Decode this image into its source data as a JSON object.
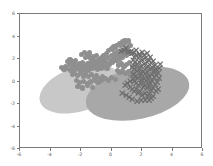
{
  "chart_data": {
    "type": "scatter",
    "title": "",
    "xlabel": "",
    "ylabel": "",
    "xlim": [
      -6,
      6
    ],
    "ylim": [
      -6,
      6
    ],
    "grid": false,
    "legend": null,
    "xticks": [
      "-6",
      "-4",
      "-2",
      "0",
      "2",
      "4",
      "6"
    ],
    "yticks": [
      "-6",
      "-4",
      "-2",
      "0",
      "2",
      "4",
      "6"
    ],
    "xtick_values": [
      -6,
      -4,
      -2,
      0,
      2,
      4,
      6
    ],
    "ytick_values": [
      -6,
      -4,
      -2,
      0,
      2,
      4,
      6
    ],
    "background_color": "#ffffff",
    "axis_color": "#7a7a7a",
    "tick_label_color": "#5b5b5b",
    "ellipses": [
      {
        "name": "cluster-ellipse-left",
        "center": [
          -2.05,
          -0.62
        ],
        "width": 2.75,
        "height": 1.95,
        "angle": -18,
        "color": "#c8c8c8",
        "opacity": 1
      },
      {
        "name": "cluster-ellipse-right",
        "center": [
          1.72,
          -1.02
        ],
        "width": 3.45,
        "height": 2.25,
        "angle": -12,
        "color": "#a8a8a8",
        "opacity": 1
      }
    ],
    "series": [
      {
        "name": "cluster-a",
        "marker": "circle",
        "color": "#8f8f8f",
        "size": 2.6,
        "points": [
          [
            -3.3,
            1.22
          ],
          [
            -3.12,
            1.05
          ],
          [
            -3.02,
            1.34
          ],
          [
            -2.86,
            1.12
          ],
          [
            -2.74,
            1.48
          ],
          [
            -2.66,
            0.95
          ],
          [
            -2.52,
            1.26
          ],
          [
            -2.44,
            1.62
          ],
          [
            -2.36,
            1.04
          ],
          [
            -2.28,
            1.4
          ],
          [
            -2.18,
            1.18
          ],
          [
            -2.1,
            1.55
          ],
          [
            -2.02,
            0.88
          ],
          [
            -1.95,
            1.3
          ],
          [
            -1.88,
            1.68
          ],
          [
            -1.8,
            1.06
          ],
          [
            -1.72,
            1.44
          ],
          [
            -1.64,
            1.22
          ],
          [
            -1.58,
            1.6
          ],
          [
            -1.5,
            0.95
          ],
          [
            -1.44,
            1.35
          ],
          [
            -1.36,
            1.72
          ],
          [
            -1.28,
            1.14
          ],
          [
            -1.2,
            1.52
          ],
          [
            -1.14,
            1.88
          ],
          [
            -1.06,
            1.28
          ],
          [
            -0.98,
            1.66
          ],
          [
            -0.9,
            1.04
          ],
          [
            -0.84,
            1.42
          ],
          [
            -0.76,
            1.8
          ],
          [
            -0.68,
            1.2
          ],
          [
            -0.6,
            1.58
          ],
          [
            -0.54,
            1.96
          ],
          [
            -0.46,
            1.36
          ],
          [
            -0.38,
            1.74
          ],
          [
            -0.3,
            1.12
          ],
          [
            -0.24,
            2.12
          ],
          [
            -0.16,
            1.52
          ],
          [
            -0.08,
            1.9
          ],
          [
            0.0,
            2.28
          ],
          [
            0.06,
            1.68
          ],
          [
            0.14,
            2.06
          ],
          [
            0.22,
            2.44
          ],
          [
            0.3,
            1.84
          ],
          [
            0.36,
            2.22
          ],
          [
            0.44,
            2.6
          ],
          [
            0.52,
            2.0
          ],
          [
            0.6,
            2.38
          ],
          [
            0.66,
            2.76
          ],
          [
            0.74,
            2.16
          ],
          [
            0.82,
            2.54
          ],
          [
            0.9,
            2.92
          ],
          [
            0.96,
            2.32
          ],
          [
            1.04,
            2.7
          ],
          [
            1.12,
            3.08
          ],
          [
            1.2,
            2.48
          ],
          [
            -2.58,
            0.62
          ],
          [
            -2.4,
            0.74
          ],
          [
            -2.22,
            0.55
          ],
          [
            -2.04,
            0.7
          ],
          [
            -1.86,
            0.48
          ],
          [
            -1.68,
            0.66
          ],
          [
            -1.5,
            0.42
          ],
          [
            -1.32,
            0.6
          ],
          [
            -1.14,
            0.36
          ],
          [
            -0.96,
            0.54
          ],
          [
            -0.78,
            0.3
          ],
          [
            -0.6,
            0.48
          ],
          [
            -2.3,
            0.08
          ],
          [
            -2.08,
            -0.12
          ],
          [
            -1.84,
            0.02
          ],
          [
            -1.6,
            -0.18
          ],
          [
            -1.38,
            -0.04
          ],
          [
            -1.12,
            0.14
          ],
          [
            -0.88,
            -0.1
          ],
          [
            -0.64,
            0.06
          ],
          [
            -0.42,
            0.26
          ],
          [
            -0.2,
            0.1
          ],
          [
            0.02,
            0.32
          ],
          [
            0.24,
            0.16
          ],
          [
            -0.34,
            2.52
          ],
          [
            -0.18,
            2.72
          ],
          [
            -0.02,
            2.9
          ],
          [
            0.16,
            3.06
          ],
          [
            0.34,
            3.22
          ],
          [
            0.52,
            3.38
          ],
          [
            0.7,
            3.52
          ],
          [
            0.88,
            3.66
          ],
          [
            -0.5,
            2.34
          ],
          [
            -0.66,
            2.16
          ],
          [
            -0.82,
            1.98
          ],
          [
            -0.98,
            2.3
          ],
          [
            0.08,
            2.86
          ],
          [
            0.26,
            3.02
          ],
          [
            0.42,
            2.66
          ],
          [
            0.58,
            3.18
          ],
          [
            -1.7,
            2.1
          ],
          [
            -1.52,
            2.26
          ],
          [
            -1.34,
            2.02
          ],
          [
            -1.16,
            2.2
          ],
          [
            -2.9,
            1.78
          ],
          [
            -2.72,
            1.92
          ],
          [
            -2.54,
            1.74
          ],
          [
            -2.36,
            1.9
          ],
          [
            0.76,
            3.3
          ],
          [
            0.94,
            3.44
          ],
          [
            1.1,
            3.6
          ],
          [
            1.26,
            3.18
          ],
          [
            -1.96,
            2.4
          ],
          [
            -1.78,
            2.56
          ],
          [
            -1.6,
            2.38
          ],
          [
            -1.42,
            2.54
          ],
          [
            0.46,
            1.46
          ],
          [
            0.64,
            1.62
          ],
          [
            0.82,
            1.3
          ],
          [
            1.0,
            1.48
          ],
          [
            1.18,
            1.66
          ],
          [
            1.36,
            1.34
          ],
          [
            1.54,
            1.52
          ],
          [
            1.72,
            1.2
          ],
          [
            0.38,
            0.98
          ],
          [
            0.56,
            0.82
          ],
          [
            0.74,
            1.0
          ],
          [
            0.92,
            0.68
          ],
          [
            1.1,
            0.86
          ],
          [
            1.28,
            0.54
          ],
          [
            1.46,
            0.72
          ],
          [
            1.64,
            0.4
          ],
          [
            -2.2,
            -0.44
          ],
          [
            -1.88,
            -0.58
          ],
          [
            -1.56,
            -0.34
          ],
          [
            -1.24,
            -0.5
          ]
        ]
      },
      {
        "name": "cluster-b",
        "marker": "x",
        "color": "#6e6e6e",
        "size": 3.2,
        "points": [
          [
            1.34,
            3.26
          ],
          [
            1.48,
            2.94
          ],
          [
            1.62,
            3.12
          ],
          [
            1.76,
            2.8
          ],
          [
            1.9,
            2.98
          ],
          [
            2.04,
            2.66
          ],
          [
            2.18,
            2.84
          ],
          [
            2.32,
            2.52
          ],
          [
            2.46,
            2.7
          ],
          [
            2.6,
            2.38
          ],
          [
            2.74,
            2.56
          ],
          [
            2.88,
            2.24
          ],
          [
            1.42,
            2.62
          ],
          [
            1.56,
            2.44
          ],
          [
            1.7,
            2.26
          ],
          [
            1.84,
            2.44
          ],
          [
            1.98,
            2.12
          ],
          [
            2.12,
            2.3
          ],
          [
            2.26,
            1.98
          ],
          [
            2.4,
            2.16
          ],
          [
            2.54,
            1.84
          ],
          [
            2.68,
            2.02
          ],
          [
            2.82,
            1.7
          ],
          [
            2.96,
            1.88
          ],
          [
            1.38,
            2.04
          ],
          [
            1.52,
            1.86
          ],
          [
            1.66,
            1.68
          ],
          [
            1.8,
            1.86
          ],
          [
            1.94,
            1.54
          ],
          [
            2.08,
            1.72
          ],
          [
            2.22,
            1.4
          ],
          [
            2.36,
            1.58
          ],
          [
            2.5,
            1.26
          ],
          [
            2.64,
            1.44
          ],
          [
            2.78,
            1.12
          ],
          [
            2.92,
            1.3
          ],
          [
            1.44,
            1.42
          ],
          [
            1.58,
            1.24
          ],
          [
            1.72,
            1.06
          ],
          [
            1.86,
            1.24
          ],
          [
            2.0,
            0.92
          ],
          [
            2.14,
            1.1
          ],
          [
            2.28,
            0.78
          ],
          [
            2.42,
            0.96
          ],
          [
            2.56,
            0.64
          ],
          [
            2.7,
            0.82
          ],
          [
            2.84,
            0.5
          ],
          [
            2.98,
            0.68
          ],
          [
            1.5,
            0.8
          ],
          [
            1.64,
            0.62
          ],
          [
            1.78,
            0.44
          ],
          [
            1.92,
            0.62
          ],
          [
            2.06,
            0.3
          ],
          [
            2.2,
            0.48
          ],
          [
            2.34,
            0.16
          ],
          [
            2.48,
            0.34
          ],
          [
            2.62,
            0.02
          ],
          [
            2.76,
            0.2
          ],
          [
            2.9,
            -0.12
          ],
          [
            3.04,
            0.06
          ],
          [
            1.2,
            0.22
          ],
          [
            1.34,
            0.04
          ],
          [
            1.48,
            -0.14
          ],
          [
            1.62,
            0.04
          ],
          [
            1.76,
            -0.28
          ],
          [
            1.9,
            -0.1
          ],
          [
            2.04,
            -0.42
          ],
          [
            2.18,
            -0.24
          ],
          [
            2.32,
            -0.56
          ],
          [
            2.46,
            -0.38
          ],
          [
            2.6,
            -0.7
          ],
          [
            2.74,
            -0.52
          ],
          [
            0.72,
            -0.3
          ],
          [
            0.94,
            -0.46
          ],
          [
            1.16,
            -0.62
          ],
          [
            1.38,
            -0.78
          ],
          [
            0.88,
            0.46
          ],
          [
            1.06,
            0.62
          ],
          [
            1.24,
            0.78
          ],
          [
            1.42,
            0.94
          ],
          [
            3.1,
            1.96
          ],
          [
            3.18,
            2.34
          ],
          [
            3.04,
            1.52
          ],
          [
            3.14,
            1.08
          ],
          [
            1.28,
            3.48
          ],
          [
            1.46,
            3.34
          ],
          [
            1.64,
            3.54
          ],
          [
            1.82,
            3.2
          ],
          [
            2.0,
            3.38
          ],
          [
            2.16,
            3.06
          ],
          [
            2.34,
            3.24
          ],
          [
            2.52,
            2.92
          ],
          [
            0.64,
            3.42
          ],
          [
            0.8,
            3.58
          ],
          [
            0.96,
            3.74
          ],
          [
            1.12,
            3.4
          ],
          [
            1.98,
            -0.86
          ],
          [
            2.22,
            -0.94
          ],
          [
            1.7,
            -1.02
          ],
          [
            2.46,
            -0.88
          ]
        ]
      }
    ]
  }
}
